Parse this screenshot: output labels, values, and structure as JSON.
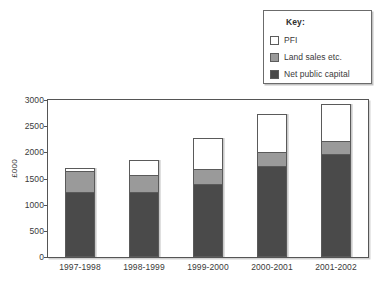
{
  "legend": {
    "title": "Key:",
    "items": [
      {
        "label": "PFI",
        "color": "#ffffff"
      },
      {
        "label": "Land sales etc.",
        "color": "#9a9a9a"
      },
      {
        "label": "Net public capital",
        "color": "#4a4a4a"
      }
    ]
  },
  "axes": {
    "ylabel": "£000",
    "yticks": [
      "0",
      "500",
      "1000",
      "1500",
      "2000",
      "2500",
      "3000"
    ]
  },
  "xlabels": [
    "1997-1998",
    "1998-1999",
    "1999-2000",
    "2000-2001",
    "2001-2002"
  ],
  "chart_data": {
    "type": "bar",
    "subtype": "stacked",
    "title": "",
    "xlabel": "",
    "ylabel": "£000",
    "ylim": [
      0,
      3000
    ],
    "ytick_step": 500,
    "grid": false,
    "legend_position": "top-right",
    "legend_title": "Key:",
    "categories": [
      "1997-1998",
      "1998-1999",
      "1999-2000",
      "2000-2001",
      "2001-2002"
    ],
    "series": [
      {
        "name": "Net public capital",
        "color": "#4a4a4a",
        "values": [
          1250,
          1240,
          1400,
          1740,
          1960
        ]
      },
      {
        "name": "Land sales etc.",
        "color": "#9a9a9a",
        "values": [
          390,
          320,
          280,
          260,
          260
        ]
      },
      {
        "name": "PFI",
        "color": "#ffffff",
        "values": [
          70,
          300,
          590,
          740,
          710
        ]
      }
    ],
    "totals": [
      1710,
      1860,
      2270,
      2740,
      2930
    ]
  }
}
